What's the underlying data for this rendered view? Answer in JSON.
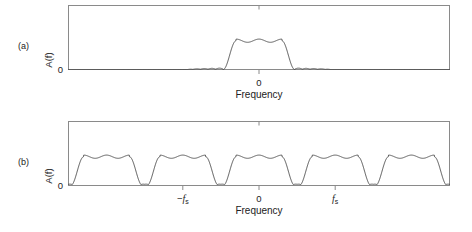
{
  "figure": {
    "title": "",
    "background_color": "#ffffff",
    "line_color": "#444444",
    "frame_color": "#8a8a8a",
    "text_color": "#222222"
  },
  "panels": [
    {
      "tag": "(a)",
      "y_axis_label": "A(f)",
      "y_zero_label": "0",
      "x_axis_label": "Frequency",
      "x_ticks": [
        {
          "value": 0,
          "label": "0",
          "label_kind": "plain"
        }
      ],
      "top_ticks": [
        0
      ]
    },
    {
      "tag": "(b)",
      "y_axis_label": "A(f)",
      "y_zero_label": "0",
      "x_axis_label": "Frequency",
      "x_ticks": [
        {
          "value": -1,
          "label": "-f_s",
          "label_kind": "math",
          "math_prefix": "−",
          "math_var": "f",
          "math_sub": "s"
        },
        {
          "value": 0,
          "label": "0",
          "label_kind": "plain"
        },
        {
          "value": 1,
          "label": "f_s",
          "label_kind": "math",
          "math_prefix": "",
          "math_var": "f",
          "math_sub": "s"
        }
      ],
      "top_ticks": [
        0
      ]
    }
  ],
  "chart_data": [
    {
      "type": "line",
      "id": "panel-a-baseband-spectrum",
      "title": "",
      "xlabel": "Frequency",
      "ylabel": "A(f)",
      "xlim": [
        -2.5,
        2.5
      ],
      "ylim": [
        0,
        1.0
      ],
      "xticks": [
        0
      ],
      "xticklabels": [
        "0"
      ],
      "yticks": [
        0
      ],
      "yticklabels": [
        "0"
      ],
      "grid": false,
      "legend": null,
      "series": [
        {
          "name": "Baseband signal spectrum A(f)",
          "description": "Single lowpass-filtered passband lobe centred at f=0 with small equiripple stopband sidelobes either side",
          "passband_half_width": 0.3,
          "transition_half_width": 0.17,
          "passband_level": 0.45,
          "passband_ripple": 0.025,
          "stopband_level": 0.018,
          "stopband_ripple": 0.016,
          "stopband_extent": 0.46,
          "centers": [
            0
          ]
        }
      ]
    },
    {
      "type": "line",
      "id": "panel-b-sampled-spectrum",
      "title": "",
      "xlabel": "Frequency",
      "ylabel": "A(f)",
      "xlim": [
        -2.5,
        2.5
      ],
      "ylim": [
        0,
        1.0
      ],
      "xticks": [
        -1,
        0,
        1
      ],
      "xticklabels": [
        "-f_s",
        "0",
        "f_s"
      ],
      "yticks": [
        0
      ],
      "yticklabels": [
        "0"
      ],
      "grid": false,
      "legend": null,
      "series": [
        {
          "name": "Sampled signal spectrum A(f) with periodic images",
          "description": "Periodic repetition of the baseband lobe at integer multiples of the sampling frequency f_s, including partial lobes at the plot edges",
          "passband_half_width": 0.3,
          "transition_half_width": 0.17,
          "passband_level": 0.45,
          "passband_ripple": 0.025,
          "stopband_level": 0.018,
          "stopband_ripple": 0.016,
          "stopband_extent": 0.46,
          "period": 1.0,
          "centers": [
            -3,
            -2,
            -1,
            0,
            1,
            2,
            3
          ]
        }
      ]
    }
  ]
}
